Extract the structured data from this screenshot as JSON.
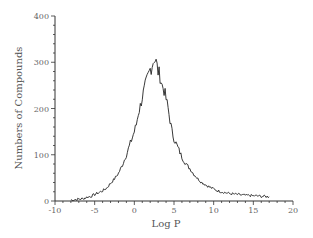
{
  "chart_data": {
    "type": "line",
    "title": "",
    "xlabel": "Log P",
    "ylabel": "Numbers of Compounds",
    "xlim": [
      -10,
      20
    ],
    "ylim": [
      0,
      400
    ],
    "x_ticks": [
      -10,
      -5,
      0,
      5,
      10,
      15,
      20
    ],
    "y_ticks": [
      0,
      100,
      200,
      300,
      400
    ],
    "grid": false,
    "legend": null,
    "series": [
      {
        "name": "Log P distribution",
        "x": [
          -8,
          -7.5,
          -7,
          -6.5,
          -6,
          -5.5,
          -5,
          -4.5,
          -4,
          -3.5,
          -3,
          -2.5,
          -2,
          -1.5,
          -1,
          -0.5,
          0,
          0.25,
          0.5,
          0.75,
          1,
          1.25,
          1.5,
          1.75,
          2,
          2.25,
          2.5,
          2.75,
          3,
          3.25,
          3.5,
          3.75,
          4,
          4.25,
          4.5,
          4.75,
          5,
          5.5,
          6,
          6.5,
          7,
          7.5,
          8,
          8.5,
          9,
          9.5,
          10,
          10.5,
          11,
          11.5,
          12,
          12.5,
          13,
          13.5,
          14,
          14.5,
          15,
          15.5,
          16,
          16.5,
          17
        ],
        "values": [
          2,
          3,
          4,
          5,
          8,
          10,
          14,
          18,
          22,
          28,
          38,
          48,
          60,
          78,
          100,
          125,
          150,
          165,
          190,
          205,
          225,
          240,
          255,
          270,
          285,
          295,
          310,
          300,
          280,
          270,
          250,
          240,
          220,
          200,
          175,
          150,
          135,
          115,
          95,
          80,
          70,
          58,
          48,
          40,
          35,
          30,
          26,
          22,
          20,
          18,
          16,
          15,
          14,
          13,
          12,
          12,
          11,
          11,
          10,
          10,
          9
        ]
      }
    ]
  },
  "axes": {
    "x_title": "Log P",
    "y_title": "Numbers of Compounds",
    "x_tick_labels": [
      "-10",
      "-5",
      "0",
      "5",
      "10",
      "15",
      "20"
    ],
    "y_tick_labels": [
      "0",
      "100",
      "200",
      "300",
      "400"
    ]
  }
}
